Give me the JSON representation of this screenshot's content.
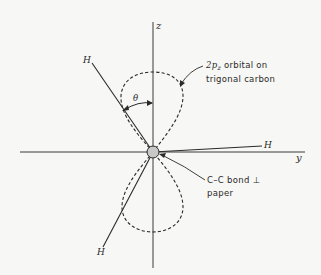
{
  "figure": {
    "axes": {
      "z_label": "z",
      "y_label": "y"
    },
    "hydrogens": {
      "upper_left": "H",
      "right": "H",
      "lower_left": "H"
    },
    "angle_label": "θ",
    "annotations": {
      "orbital_line1_prefix": "2p",
      "orbital_line1_sub": "z",
      "orbital_line1_suffix": " orbital on",
      "orbital_line2": "trigonal carbon",
      "bond_line1": "C–C bond ⊥",
      "bond_line2": "paper"
    },
    "colors": {
      "ink": "#2a2a2a",
      "atom_fill": "#c8c8c8",
      "background": "#f7f7f5"
    }
  }
}
